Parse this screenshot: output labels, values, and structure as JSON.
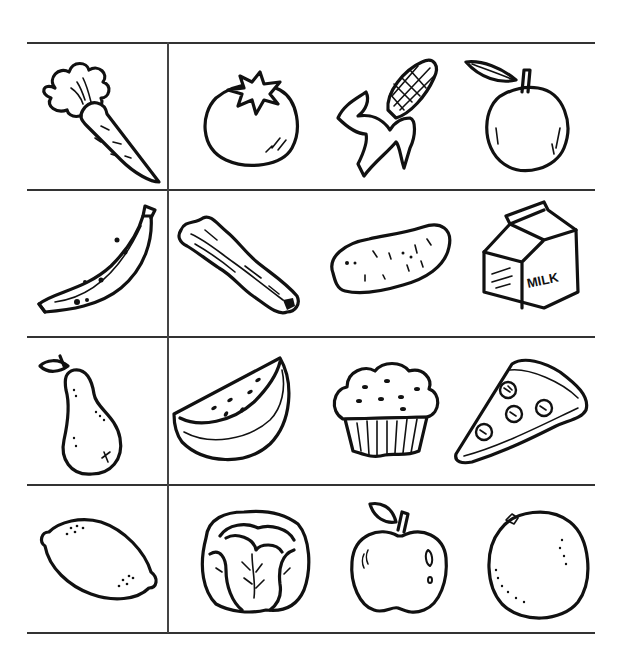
{
  "worksheet": {
    "layout": {
      "rows": 4,
      "columns": 4,
      "separated_first_column": true
    },
    "rows": [
      {
        "items": [
          {
            "name": "carrot",
            "label": ""
          },
          {
            "name": "tomato",
            "label": ""
          },
          {
            "name": "corn",
            "label": ""
          },
          {
            "name": "peach",
            "label": ""
          }
        ]
      },
      {
        "items": [
          {
            "name": "banana",
            "label": ""
          },
          {
            "name": "bacon",
            "label": ""
          },
          {
            "name": "potato",
            "label": ""
          },
          {
            "name": "milk-carton",
            "label": "MILK"
          }
        ]
      },
      {
        "items": [
          {
            "name": "pear",
            "label": ""
          },
          {
            "name": "watermelon-slice",
            "label": ""
          },
          {
            "name": "muffin",
            "label": ""
          },
          {
            "name": "pizza-slice",
            "label": ""
          }
        ]
      },
      {
        "items": [
          {
            "name": "lemon",
            "label": ""
          },
          {
            "name": "cabbage",
            "label": ""
          },
          {
            "name": "apple",
            "label": ""
          },
          {
            "name": "orange",
            "label": ""
          }
        ]
      }
    ],
    "colors": {
      "ink": "#111111",
      "rule": "#333333",
      "background": "#ffffff"
    }
  }
}
